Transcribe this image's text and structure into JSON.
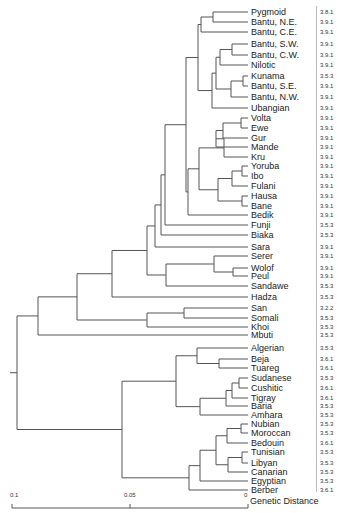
{
  "figure": {
    "axis_title": "Genetic Distance",
    "scale_ticks": [
      {
        "label": "0.1",
        "value": 0.1
      },
      {
        "label": "0.05",
        "value": 0.05
      },
      {
        "label": "0",
        "value": 0
      }
    ]
  },
  "leaves": [
    {
      "name": "Pygmoid",
      "code": "3.8.1",
      "y": 12
    },
    {
      "name": "Bantu, N.E.",
      "code": "3.9.1",
      "y": 22
    },
    {
      "name": "Bantu, C.E.",
      "code": "3.9.1",
      "y": 32
    },
    {
      "name": "Bantu, S.W.",
      "code": "3.9.1",
      "y": 44
    },
    {
      "name": "Bantu, C.W.",
      "code": "3.9.1",
      "y": 55
    },
    {
      "name": "Nilotic",
      "code": "3.9.1",
      "y": 65
    },
    {
      "name": "Kunama",
      "code": "3.5.3",
      "y": 76
    },
    {
      "name": "Bantu, S.E.",
      "code": "3.9.1",
      "y": 86
    },
    {
      "name": "Bantu, N.W.",
      "code": "3.9.1",
      "y": 97
    },
    {
      "name": "Ubangian",
      "code": "3.9.1",
      "y": 108
    },
    {
      "name": "Volta",
      "code": "3.9.1",
      "y": 118
    },
    {
      "name": "Ewe",
      "code": "3.9.1",
      "y": 128
    },
    {
      "name": "Gur",
      "code": "3.9.1",
      "y": 138
    },
    {
      "name": "Mande",
      "code": "3.9.1",
      "y": 147
    },
    {
      "name": "Kru",
      "code": "3.9.1",
      "y": 157
    },
    {
      "name": "Yoruba",
      "code": "3.9.1",
      "y": 166
    },
    {
      "name": "Ibo",
      "code": "3.9.1",
      "y": 176
    },
    {
      "name": "Fulani",
      "code": "3.9.1",
      "y": 186
    },
    {
      "name": "Hausa",
      "code": "3.9.1",
      "y": 196
    },
    {
      "name": "Bane",
      "code": "3.9.1",
      "y": 206
    },
    {
      "name": "Bedik",
      "code": "3.9.1",
      "y": 215
    },
    {
      "name": "Funji",
      "code": "3.5.3",
      "y": 225
    },
    {
      "name": "Biaka",
      "code": "3.5.3",
      "y": 235
    },
    {
      "name": "Sara",
      "code": "3.9.1",
      "y": 247
    },
    {
      "name": "Serer",
      "code": "3.9.1",
      "y": 256
    },
    {
      "name": "Wolof",
      "code": "3.9.1",
      "y": 268
    },
    {
      "name": "Peul",
      "code": "3.9.1",
      "y": 276
    },
    {
      "name": "Sandawe",
      "code": "3.5.3",
      "y": 286
    },
    {
      "name": "Hadza",
      "code": "3.5.3",
      "y": 297
    },
    {
      "name": "San",
      "code": "3.2.2",
      "y": 308
    },
    {
      "name": "Somali",
      "code": "3.5.3",
      "y": 318
    },
    {
      "name": "Khoi",
      "code": "3.5.3",
      "y": 327
    },
    {
      "name": "Mbuti",
      "code": "3.5.3",
      "y": 335
    },
    {
      "name": "Algerian",
      "code": "3.5.3",
      "y": 348
    },
    {
      "name": "Beja",
      "code": "3.6.1",
      "y": 359
    },
    {
      "name": "Tuareg",
      "code": "3.6.1",
      "y": 368
    },
    {
      "name": "Sudanese",
      "code": "3.5.3",
      "y": 378
    },
    {
      "name": "Cushitic",
      "code": "3.6.1",
      "y": 388
    },
    {
      "name": "Tigray",
      "code": "3.6.1",
      "y": 398
    },
    {
      "name": "Baria",
      "code": "3.5.3",
      "y": 406
    },
    {
      "name": "Amhara",
      "code": "3.5.3",
      "y": 415
    },
    {
      "name": "Nubian",
      "code": "3.5.3",
      "y": 424
    },
    {
      "name": "Moroccan",
      "code": "3.5.3",
      "y": 433
    },
    {
      "name": "Bedouin",
      "code": "3.6.1",
      "y": 443
    },
    {
      "name": "Tunisian",
      "code": "3.5.3",
      "y": 452
    },
    {
      "name": "Libyan",
      "code": "3.5.3",
      "y": 463
    },
    {
      "name": "Canarian",
      "code": "3.5.3",
      "y": 472
    },
    {
      "name": "Egyptian",
      "code": "3.5.3",
      "y": 481
    },
    {
      "name": "Berber",
      "code": "3.6.1",
      "y": 490
    }
  ],
  "tree": {
    "leaf_x": 248,
    "nodes": [
      {
        "id": "n_pyg_ne",
        "x": 213,
        "children": [
          "L0",
          "L1"
        ]
      },
      {
        "id": "n_top3",
        "x": 201,
        "children": [
          "n_pyg_ne",
          "L2"
        ]
      },
      {
        "id": "n_sw_cw",
        "x": 232,
        "children": [
          "L3",
          "L4"
        ]
      },
      {
        "id": "n_swcw_nil",
        "x": 220,
        "children": [
          "n_sw_cw",
          "L5"
        ]
      },
      {
        "id": "n_kun_se",
        "x": 243,
        "children": [
          "L6",
          "L7"
        ]
      },
      {
        "id": "n_kse_nw",
        "x": 231,
        "children": [
          "n_kun_se",
          "L8"
        ]
      },
      {
        "id": "n_mid",
        "x": 216,
        "children": [
          "n_swcw_nil",
          "n_kse_nw"
        ]
      },
      {
        "id": "n_mid_ub",
        "x": 212,
        "children": [
          "n_mid",
          "L9"
        ]
      },
      {
        "id": "n_bantu",
        "x": 198,
        "children": [
          "n_top3",
          "n_mid_ub"
        ]
      },
      {
        "id": "n_volta_ewe",
        "x": 241,
        "children": [
          "L10",
          "L11"
        ]
      },
      {
        "id": "n_ve_gur",
        "x": 223,
        "children": [
          "n_volta_ewe",
          "L12"
        ]
      },
      {
        "id": "n_ve_mande",
        "x": 216,
        "children": [
          "n_ve_gur",
          "L13"
        ]
      },
      {
        "id": "n_ve_kru",
        "x": 224,
        "children": [
          "n_ve_mande",
          "L14"
        ]
      },
      {
        "id": "n_yor_ibo",
        "x": 242,
        "children": [
          "L15",
          "L16"
        ]
      },
      {
        "id": "n_yi_ful",
        "x": 232,
        "children": [
          "n_yor_ibo",
          "L17"
        ]
      },
      {
        "id": "n_hau_ban",
        "x": 242,
        "children": [
          "L18",
          "L19"
        ]
      },
      {
        "id": "n_nig",
        "x": 218,
        "children": [
          "n_yi_ful",
          "n_hau_ban"
        ]
      },
      {
        "id": "n_west",
        "x": 199,
        "children": [
          "n_ve_kru",
          "n_nig"
        ]
      },
      {
        "id": "n_west_b",
        "x": 188,
        "children": [
          "n_west",
          "L20"
        ]
      },
      {
        "id": "n_nc",
        "x": 186,
        "children": [
          "n_bantu",
          "n_west_b"
        ]
      },
      {
        "id": "n_nc_funji",
        "x": 165,
        "children": [
          "n_nc",
          "L21"
        ]
      },
      {
        "id": "n_nc_biaka",
        "x": 161,
        "children": [
          "n_nc_funji",
          "L22"
        ]
      },
      {
        "id": "n_sara",
        "x": 155,
        "children": [
          "n_nc_biaka",
          "L23"
        ]
      },
      {
        "id": "n_wolof_peul",
        "x": 233,
        "children": [
          "L25",
          "L26"
        ]
      },
      {
        "id": "n_ser_wp",
        "x": 214,
        "children": [
          "L24",
          "n_wolof_peul"
        ]
      },
      {
        "id": "n_ser_sand",
        "x": 166,
        "children": [
          "n_ser_wp",
          "L27"
        ]
      },
      {
        "id": "n_sara_ser",
        "x": 147,
        "children": [
          "n_sara",
          "n_ser_sand"
        ]
      },
      {
        "id": "n_hadza",
        "x": 112,
        "children": [
          "n_sara_ser",
          "L28"
        ]
      },
      {
        "id": "n_san_som",
        "x": 184,
        "children": [
          "L29",
          "L30"
        ]
      },
      {
        "id": "n_ss_khoi",
        "x": 147,
        "children": [
          "n_san_som",
          "L31"
        ]
      },
      {
        "id": "n_sub",
        "x": 77,
        "children": [
          "n_hadza",
          "n_ss_khoi"
        ]
      },
      {
        "id": "n_sub_mbuti",
        "x": 38,
        "children": [
          "n_sub",
          "L32"
        ]
      },
      {
        "id": "n_beja_tua",
        "x": 219,
        "children": [
          "L34",
          "L35"
        ]
      },
      {
        "id": "n_bt_alg",
        "x": 197,
        "children": [
          "L33",
          "n_beja_tua"
        ]
      },
      {
        "id": "n_sud_cus",
        "x": 239,
        "children": [
          "L36",
          "L37"
        ]
      },
      {
        "id": "n_sc_tig",
        "x": 232,
        "children": [
          "n_sud_cus",
          "L38"
        ]
      },
      {
        "id": "n_sct_bar",
        "x": 226,
        "children": [
          "n_sc_tig",
          "L39"
        ]
      },
      {
        "id": "n_east",
        "x": 200,
        "children": [
          "n_sct_bar",
          "L40"
        ]
      },
      {
        "id": "n_nea",
        "x": 176,
        "children": [
          "n_bt_alg",
          "n_east"
        ]
      },
      {
        "id": "n_nub_mor",
        "x": 241,
        "children": [
          "L41",
          "L42"
        ]
      },
      {
        "id": "n_nm_bed",
        "x": 227,
        "children": [
          "n_nub_mor",
          "L43"
        ]
      },
      {
        "id": "n_tun_lib",
        "x": 242,
        "children": [
          "L44",
          "L45"
        ]
      },
      {
        "id": "n_tl_can",
        "x": 228,
        "children": [
          "n_tun_lib",
          "L46"
        ]
      },
      {
        "id": "n_maghreb",
        "x": 216,
        "children": [
          "n_nm_bed",
          "n_tl_can"
        ]
      },
      {
        "id": "n_mag_egy",
        "x": 200,
        "children": [
          "n_maghreb",
          "L47"
        ]
      },
      {
        "id": "n_mag_ber",
        "x": 189,
        "children": [
          "n_mag_egy",
          "L48"
        ]
      },
      {
        "id": "n_north",
        "x": 122,
        "children": [
          "n_nea",
          "n_mag_ber"
        ]
      },
      {
        "id": "root",
        "x": 17,
        "children": [
          "n_sub_mbuti",
          "n_north"
        ]
      }
    ]
  }
}
